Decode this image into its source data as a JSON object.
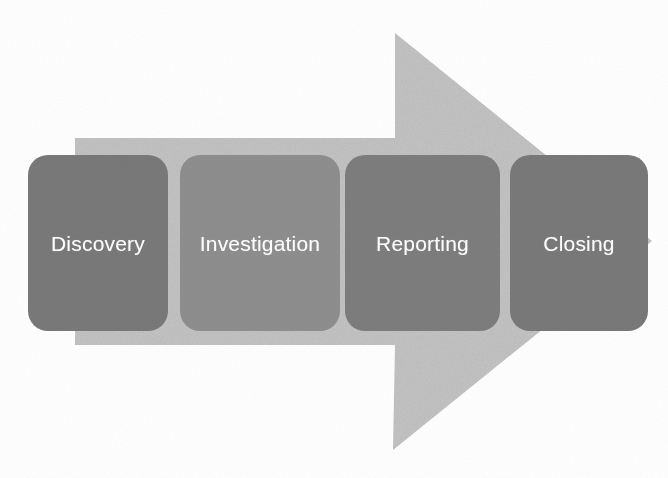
{
  "diagram": {
    "type": "process-flow-arrow",
    "orientation": "left-to-right",
    "background_color": "#ffffff",
    "arrow": {
      "name": "background-process-arrow",
      "direction": "right",
      "fill_color": "#c6c6c6",
      "body_top_y": 138,
      "body_bottom_y": 345,
      "head_apex_top_y": 33,
      "head_point_bottom_y": 450,
      "head_tip_x": 652
    },
    "stages": [
      {
        "index": 1,
        "label": "Discovery",
        "fill_color": "#797979",
        "text_color": "#ffffff"
      },
      {
        "index": 2,
        "label": "Investigation",
        "fill_color": "#8e8e8e",
        "text_color": "#ffffff"
      },
      {
        "index": 3,
        "label": "Reporting",
        "fill_color": "#7d7d7d",
        "text_color": "#ffffff"
      },
      {
        "index": 4,
        "label": "Closing",
        "fill_color": "#797979",
        "text_color": "#ffffff"
      }
    ]
  }
}
